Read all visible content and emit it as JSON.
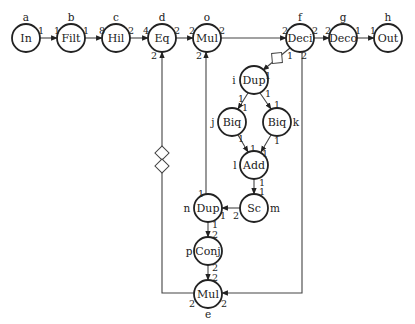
{
  "nodes": [
    {
      "key": "a",
      "label": "In",
      "id": "a",
      "x": 26,
      "y": 38,
      "id_x": 26,
      "id_y": 17
    },
    {
      "key": "b",
      "label": "Filt",
      "id": "b",
      "x": 71,
      "y": 38,
      "id_x": 71,
      "id_y": 17
    },
    {
      "key": "c",
      "label": "Hil",
      "id": "c",
      "x": 116,
      "y": 38,
      "id_x": 116,
      "id_y": 17
    },
    {
      "key": "d",
      "label": "Eq",
      "id": "d",
      "x": 162,
      "y": 38,
      "id_x": 162,
      "id_y": 17
    },
    {
      "key": "o",
      "label": "Mul",
      "id": "o",
      "x": 207,
      "y": 38,
      "id_x": 207,
      "id_y": 17
    },
    {
      "key": "f",
      "label": "Deci",
      "id": "f",
      "x": 300,
      "y": 38,
      "id_x": 300,
      "id_y": 17
    },
    {
      "key": "g",
      "label": "Deco",
      "id": "g",
      "x": 343,
      "y": 38,
      "id_x": 343,
      "id_y": 17
    },
    {
      "key": "h",
      "label": "Out",
      "id": "h",
      "x": 388,
      "y": 38,
      "id_x": 388,
      "id_y": 17
    },
    {
      "key": "i",
      "label": "Dup",
      "id": "i",
      "x": 254,
      "y": 80,
      "id_x": 234,
      "id_y": 80
    },
    {
      "key": "j",
      "label": "Biq",
      "id": "j",
      "x": 232,
      "y": 122,
      "id_x": 213,
      "id_y": 122
    },
    {
      "key": "k",
      "label": "Biq",
      "id": "k",
      "x": 277,
      "y": 122,
      "id_x": 296,
      "id_y": 122
    },
    {
      "key": "l",
      "label": "Add",
      "id": "l",
      "x": 254,
      "y": 165,
      "id_x": 235,
      "id_y": 165
    },
    {
      "key": "m",
      "label": "Sc",
      "id": "m",
      "x": 254,
      "y": 208,
      "id_x": 275,
      "id_y": 208
    },
    {
      "key": "n",
      "label": "Dup",
      "id": "n",
      "x": 208,
      "y": 208,
      "id_x": 187,
      "id_y": 208
    },
    {
      "key": "p",
      "label": "Conj",
      "id": "p",
      "x": 208,
      "y": 251,
      "id_x": 189,
      "id_y": 251
    },
    {
      "key": "e",
      "label": "Mul",
      "id": "e",
      "x": 208,
      "y": 294,
      "id_x": 208,
      "id_y": 314
    }
  ],
  "ports": [
    {
      "text": "1",
      "x": 41,
      "y": 30
    },
    {
      "text": "1",
      "x": 57,
      "y": 30
    },
    {
      "text": "1",
      "x": 86,
      "y": 30
    },
    {
      "text": "8",
      "x": 102,
      "y": 30
    },
    {
      "text": "2",
      "x": 131,
      "y": 30
    },
    {
      "text": "4",
      "x": 146,
      "y": 30
    },
    {
      "text": "2",
      "x": 177,
      "y": 30
    },
    {
      "text": "2",
      "x": 192,
      "y": 30
    },
    {
      "text": "2",
      "x": 222,
      "y": 30
    },
    {
      "text": "2",
      "x": 285,
      "y": 30
    },
    {
      "text": "2",
      "x": 315,
      "y": 30
    },
    {
      "text": "2",
      "x": 328,
      "y": 30
    },
    {
      "text": "1",
      "x": 358,
      "y": 30
    },
    {
      "text": "1",
      "x": 373,
      "y": 30
    },
    {
      "text": "2",
      "x": 154,
      "y": 55
    },
    {
      "text": "2",
      "x": 199,
      "y": 55
    },
    {
      "text": "1",
      "x": 290,
      "y": 55
    },
    {
      "text": "2",
      "x": 304,
      "y": 55
    },
    {
      "text": "1",
      "x": 268,
      "y": 75
    },
    {
      "text": "1",
      "x": 241,
      "y": 98
    },
    {
      "text": "1",
      "x": 268,
      "y": 93
    },
    {
      "text": "1",
      "x": 245,
      "y": 107
    },
    {
      "text": "1",
      "x": 277,
      "y": 104
    },
    {
      "text": "1",
      "x": 241,
      "y": 138
    },
    {
      "text": "1",
      "x": 277,
      "y": 140
    },
    {
      "text": "1",
      "x": 253,
      "y": 148
    },
    {
      "text": "1",
      "x": 265,
      "y": 153
    },
    {
      "text": "1",
      "x": 262,
      "y": 182
    },
    {
      "text": "1",
      "x": 262,
      "y": 191
    },
    {
      "text": "1",
      "x": 201,
      "y": 193
    },
    {
      "text": "1",
      "x": 223,
      "y": 215
    },
    {
      "text": "2",
      "x": 236,
      "y": 215
    },
    {
      "text": "1",
      "x": 215,
      "y": 224
    },
    {
      "text": "2",
      "x": 215,
      "y": 234
    },
    {
      "text": "2",
      "x": 215,
      "y": 267
    },
    {
      "text": "2",
      "x": 215,
      "y": 277
    },
    {
      "text": "2",
      "x": 192,
      "y": 303
    },
    {
      "text": "2",
      "x": 224,
      "y": 303
    }
  ],
  "edges": [
    {
      "name": "edge-a-b",
      "d": "M40 38 L57 38"
    },
    {
      "name": "edge-b-c",
      "d": "M85 38 L102 38"
    },
    {
      "name": "edge-c-d",
      "d": "M130 38 L148 38"
    },
    {
      "name": "edge-d-o",
      "d": "M176 38 L193 38"
    },
    {
      "name": "edge-o-f",
      "d": "M221 38 L286 38"
    },
    {
      "name": "edge-f-g",
      "d": "M314 38 L329 38"
    },
    {
      "name": "edge-g-h",
      "d": "M357 38 L374 38"
    },
    {
      "name": "edge-f-i",
      "d": "M290 48 L263 70"
    },
    {
      "name": "edge-i-j",
      "d": "M248 93 L238 109"
    },
    {
      "name": "edge-i-k",
      "d": "M260 93 L271 109"
    },
    {
      "name": "edge-j-l",
      "d": "M238 135 L248 152"
    },
    {
      "name": "edge-k-l",
      "d": "M271 135 L261 152"
    },
    {
      "name": "edge-l-m",
      "d": "M254 179 L254 194"
    },
    {
      "name": "edge-m-n",
      "d": "M240 208 L222 208"
    },
    {
      "name": "edge-n-o",
      "d": "M206 194 L206 52"
    },
    {
      "name": "edge-n-p",
      "d": "M208 222 L208 237"
    },
    {
      "name": "edge-p-e",
      "d": "M208 265 L208 280"
    },
    {
      "name": "edge-f-e",
      "d": "M302 52 L302 293 L222 293"
    },
    {
      "name": "edge-e-d",
      "d": "M194 293 L162 293 L162 52"
    }
  ],
  "delays": [
    {
      "name": "delay-marker-f-i",
      "cx": 277,
      "cy": 58,
      "rot": 40
    },
    {
      "name": "delay-marker-e-d-1",
      "cx": 162,
      "cy": 153,
      "rot": 0
    },
    {
      "name": "delay-marker-e-d-2",
      "cx": 162,
      "cy": 166,
      "rot": 0
    }
  ],
  "style": {
    "stroke": "#222222",
    "background": "#ffffff"
  }
}
